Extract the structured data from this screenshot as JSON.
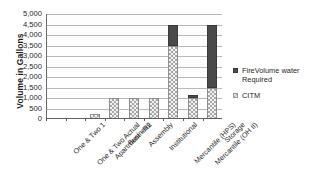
{
  "chart_data": {
    "type": "bar",
    "stacked": true,
    "title": "",
    "xlabel": "",
    "ylabel": "Volume in Gallons",
    "ylim": [
      0,
      5000
    ],
    "ytick_step": 500,
    "ytick_labels": [
      "5,000",
      "4,500",
      "4,000",
      "3,500",
      "3,000",
      "2,500",
      "2,000",
      "1,500",
      "1,000",
      "500",
      "0"
    ],
    "grid": true,
    "legend_position": "right",
    "categories": [
      "One & Two 1",
      "One & Two Actual",
      "Apartment - R2",
      "Business",
      "Assembly",
      "Institutional",
      "Mercantile (HPS)",
      "Mercantile (OH II)",
      "Storage"
    ],
    "series": [
      {
        "name": "CITM",
        "color": "#c2c2c2",
        "values": [
          0,
          0,
          250,
          1000,
          1000,
          1000,
          3500,
          1000,
          1500
        ]
      },
      {
        "name": "FireVolume water Required",
        "color": "#4a4a4a",
        "values": [
          0,
          0,
          0,
          0,
          0,
          0,
          1000,
          150,
          3000
        ]
      }
    ]
  },
  "axis": {
    "y_title": "Volume in Gallons"
  },
  "legend": {
    "entries": [
      {
        "label": "FireVolume water Required",
        "marker": "square-dark-icon"
      },
      {
        "label": "CITM",
        "marker": "square-checkered-icon"
      }
    ]
  }
}
